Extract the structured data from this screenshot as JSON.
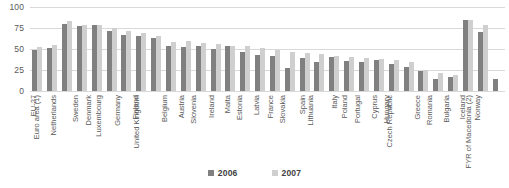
{
  "chart_data": {
    "type": "bar",
    "title": "",
    "subtitle": "",
    "xlabel": "",
    "ylabel": "",
    "ylim": [
      0,
      100
    ],
    "yticks": [
      100,
      75,
      50,
      25,
      0
    ],
    "grid": true,
    "legend_position": "bottom",
    "categories": [
      "EU-27",
      "Euro area (1)",
      "Netherlands",
      "Sweden",
      "Denmark",
      "Luxembourg",
      "Germany",
      "Finland",
      "United Kingdom",
      "Belgium",
      "Austria",
      "Slovenia",
      "Ireland",
      "Malta",
      "Estonia",
      "Latvia",
      "France",
      "Slovakia",
      "Spain",
      "Lithuania",
      "Italy",
      "Poland",
      "Portugal",
      "Cyprus",
      "Hungary",
      "Czech Republic",
      "Greece",
      "Romania",
      "Bulgaria",
      "Iceland",
      "Norway",
      "FYR of Macedonia (2)"
    ],
    "series": [
      {
        "name": "2006",
        "color": "#808080",
        "values": [
          49,
          51,
          80,
          77,
          79,
          71,
          67,
          65,
          63,
          53,
          52,
          54,
          50,
          53,
          46,
          43,
          42,
          27,
          39,
          35,
          41,
          36,
          35,
          37,
          32,
          29,
          24,
          14,
          17,
          84,
          70,
          14
        ]
      },
      {
        "name": "2007",
        "color": "#cfcfcf",
        "values": [
          52,
          55,
          83,
          79,
          78,
          75,
          71,
          69,
          65,
          58,
          60,
          57,
          56,
          54,
          53,
          51,
          49,
          46,
          45,
          44,
          42,
          41,
          39,
          38,
          37,
          35,
          25,
          22,
          19,
          84,
          78,
          null
        ]
      }
    ]
  },
  "legend": {
    "items": [
      {
        "label": "2006"
      },
      {
        "label": "2007"
      }
    ]
  }
}
